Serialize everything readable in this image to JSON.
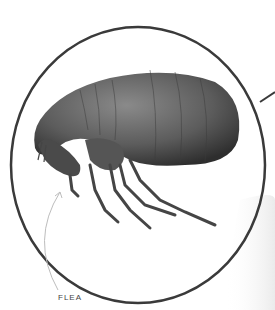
{
  "callout": {
    "label": "FLEA",
    "circle_color": "#3a3a3a",
    "body_color": "#5a5a5a"
  }
}
